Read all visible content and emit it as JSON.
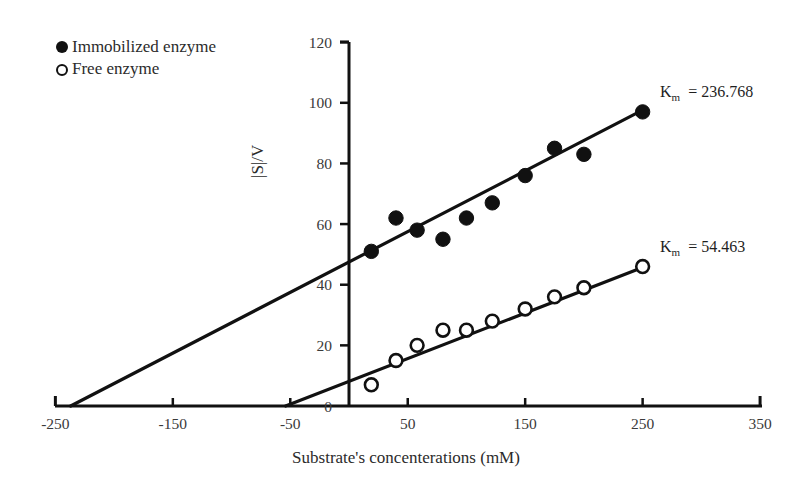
{
  "chart_data": {
    "type": "scatter",
    "title": "",
    "xlabel": "Substrate's concenterations (mM)",
    "ylabel": "|S|/V",
    "xlim": [
      -270,
      370
    ],
    "ylim": [
      -6,
      124
    ],
    "xticks": [
      -250,
      -150,
      -50,
      50,
      150,
      250,
      350
    ],
    "xticklabels": [
      "-250",
      "-150",
      "-50",
      "50",
      "150",
      "250",
      "350"
    ],
    "yticks": [
      0,
      20,
      40,
      60,
      80,
      100,
      120
    ],
    "yticklabels": [
      "0",
      "20",
      "40",
      "60",
      "80",
      "100",
      "120"
    ],
    "grid": false,
    "legend_position": "top-left",
    "series": [
      {
        "name": "Immobilized enzyme",
        "marker": "filled-circle",
        "color": "#111111",
        "points": [
          {
            "x": 19,
            "y": 51
          },
          {
            "x": 40,
            "y": 62
          },
          {
            "x": 58,
            "y": 58
          },
          {
            "x": 80,
            "y": 55
          },
          {
            "x": 100,
            "y": 62
          },
          {
            "x": 122,
            "y": 67
          },
          {
            "x": 150,
            "y": 76
          },
          {
            "x": 175,
            "y": 85
          },
          {
            "x": 200,
            "y": 83
          },
          {
            "x": 250,
            "y": 97
          }
        ],
        "fit_line": {
          "x0": -237,
          "y0": 0,
          "x1": 252,
          "y1": 98
        },
        "annotation": "K_m = 236.768",
        "annotation_symbol": "K",
        "annotation_subscript": "m",
        "annotation_value": "= 236.768"
      },
      {
        "name": "Free enzyme",
        "marker": "open-circle",
        "color": "#111111",
        "points": [
          {
            "x": 19,
            "y": 7
          },
          {
            "x": 40,
            "y": 15
          },
          {
            "x": 58,
            "y": 20
          },
          {
            "x": 80,
            "y": 25
          },
          {
            "x": 100,
            "y": 25
          },
          {
            "x": 122,
            "y": 28
          },
          {
            "x": 150,
            "y": 32
          },
          {
            "x": 175,
            "y": 36
          },
          {
            "x": 200,
            "y": 39
          },
          {
            "x": 250,
            "y": 46
          }
        ],
        "fit_line": {
          "x0": -54,
          "y0": 0,
          "x1": 252,
          "y1": 46
        },
        "annotation": "K_m = 54.463",
        "annotation_symbol": "K",
        "annotation_subscript": "m",
        "annotation_value": "= 54.463"
      }
    ]
  },
  "legend": {
    "items": [
      {
        "label": "Immobilized enzyme",
        "marker": "filled-circle"
      },
      {
        "label": "Free enzyme",
        "marker": "open-circle"
      }
    ]
  },
  "axes": {
    "x_title": "Substrate's concenterations (mM)",
    "y_title": "|S|/V"
  },
  "colors": {
    "ink": "#111111",
    "tick_text": "#3a3a3a",
    "background": "#ffffff"
  }
}
